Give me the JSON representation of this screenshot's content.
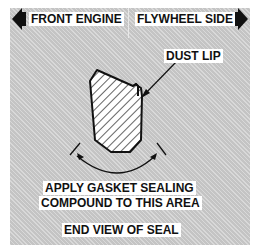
{
  "header": {
    "left_label": "FRONT ENGINE",
    "right_label": "FLYWHEEL SIDE",
    "left_arrow_icon": "arrow-left-icon",
    "right_arrow_icon": "arrow-right-icon"
  },
  "diagram": {
    "callout_label": "DUST LIP",
    "instruction_line1": "APPLY GASKET SEALING",
    "instruction_line2": "COMPOUND TO THIS AREA",
    "caption": "END VIEW OF SEAL"
  },
  "colors": {
    "panel": "#c4c4c4",
    "ink": "#111111",
    "label_bg": "#ffffff"
  }
}
